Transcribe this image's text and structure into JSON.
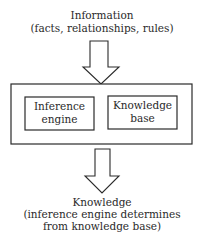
{
  "diagram": {
    "input": {
      "title": "Information",
      "subtitle": "(facts, relationships, rules)"
    },
    "system": {
      "components": [
        {
          "line1": "Inference",
          "line2": "engine"
        },
        {
          "line1": "Knowledge",
          "line2": "base"
        }
      ]
    },
    "output": {
      "title": "Knowledge",
      "subtitle_line1": "(inference engine determines",
      "subtitle_line2": "from knowledge base)"
    },
    "colors": {
      "stroke": "#2a2a2a",
      "background": "#ffffff"
    }
  }
}
